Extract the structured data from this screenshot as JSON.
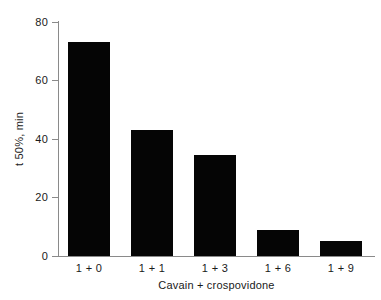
{
  "chart_data": {
    "type": "bar",
    "title": "",
    "subtitle": "",
    "xlabel": "Cavain + crospovidone",
    "ylabel": "t 50%, min",
    "categories": [
      "1 + 0",
      "1 + 1",
      "1 + 3",
      "1 + 6",
      "1 + 9"
    ],
    "values": [
      73,
      43,
      34.5,
      9,
      5
    ],
    "ylim": [
      0,
      80
    ],
    "yticks": [
      0,
      20,
      40,
      60,
      80
    ],
    "ytick_labels": [
      "0",
      "20",
      "40",
      "60",
      "80"
    ],
    "grid": false,
    "legend": null,
    "legend_position": "none",
    "bar_color": "#050505",
    "axis_color": "#8a8a8a",
    "background_color": "#ffffff",
    "text_color": "#1a1a1a",
    "annotations": []
  }
}
